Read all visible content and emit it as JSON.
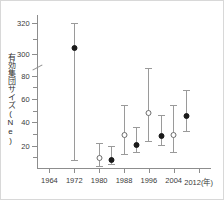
{
  "chart_data": {
    "type": "scatter",
    "title": "",
    "xlabel": "年",
    "ylabel": "有効集団サイズ(Ne)",
    "grid": false,
    "legend": "none",
    "axis_break": {
      "present": true,
      "between": [
        85,
        295
      ]
    },
    "xlim": [
      1960,
      2016
    ],
    "xticks": [
      "1964",
      "1972",
      "1980",
      "1988",
      "1996",
      "2004",
      "2012(年)"
    ],
    "xtick_values": [
      1964,
      1972,
      1980,
      1988,
      1996,
      2004,
      2012
    ],
    "yticks": [
      "20",
      "40",
      "60",
      "80",
      "300",
      "320"
    ],
    "ytick_values": [
      20,
      40,
      60,
      80,
      300,
      320
    ],
    "ylim_lower": [
      0,
      85
    ],
    "ylim_upper": [
      295,
      325
    ],
    "series": [
      {
        "name": "filled-circle",
        "marker": "filled",
        "points": [
          {
            "x": 1972,
            "y": 306,
            "lo": 8,
            "hi": 320
          },
          {
            "x": 1984,
            "y": 10,
            "lo": 4,
            "hi": 20
          },
          {
            "x": 1992,
            "y": 23,
            "lo": 15,
            "hi": 36
          },
          {
            "x": 2000,
            "y": 31,
            "lo": 21,
            "hi": 46
          },
          {
            "x": 2008,
            "y": 48,
            "lo": 33,
            "hi": 68
          }
        ]
      },
      {
        "name": "open-circle",
        "marker": "open",
        "points": [
          {
            "x": 1980,
            "y": 12,
            "lo": 3,
            "hi": 22
          },
          {
            "x": 1988,
            "y": 32,
            "lo": 13,
            "hi": 55
          },
          {
            "x": 1996,
            "y": 51,
            "lo": 24,
            "hi": 87
          },
          {
            "x": 2004,
            "y": 32,
            "lo": 15,
            "hi": 55
          }
        ]
      }
    ]
  },
  "colors": {
    "axis": "#8d8d8d",
    "whisker": "#9a9a9a",
    "filled_marker": "#1a1a1a",
    "open_marker_edge": "#6e6e6e",
    "text": "#3a3a3a",
    "frame": "#d8d8d8"
  }
}
